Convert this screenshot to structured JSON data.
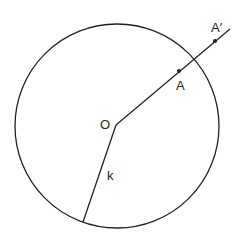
{
  "diagram": {
    "labels": {
      "center": "O",
      "point_a": "A",
      "point_a_prime": "A′",
      "radius": "k"
    },
    "colors": {
      "stroke": "#222222",
      "background": "#ffffff"
    }
  }
}
